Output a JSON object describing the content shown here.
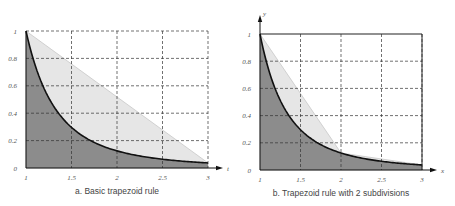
{
  "chart_data": [
    {
      "type": "area",
      "title": "a. Basic trapezoid rule",
      "function": "1/t^3",
      "xlabel": "t",
      "ylabel": "",
      "x_ticks": [
        "1",
        "1.5",
        "2",
        "2.5",
        "3"
      ],
      "y_ticks": [
        "0",
        "0.2",
        "0.4",
        "0.6",
        "0.8",
        "1"
      ],
      "xlim": [
        1,
        3
      ],
      "ylim": [
        0,
        1
      ],
      "grid": true,
      "curve": {
        "x": [
          1,
          1.25,
          1.5,
          1.75,
          2,
          2.5,
          3
        ],
        "y": [
          1,
          0.512,
          0.296,
          0.187,
          0.125,
          0.064,
          0.037
        ]
      },
      "trapezoids": [
        {
          "x": [
            1,
            3
          ],
          "y": [
            1,
            0.037
          ]
        }
      ]
    },
    {
      "type": "area",
      "title": "b. Trapezoid rule with 2 subdivisions",
      "function": "1/x^3",
      "xlabel": "x",
      "ylabel": "y",
      "x_ticks": [
        "1",
        "1.5",
        "2",
        "2.5",
        "3"
      ],
      "y_ticks": [
        "0",
        "0.2",
        "0.4",
        "0.6",
        "0.8",
        "1"
      ],
      "xlim": [
        1,
        3
      ],
      "ylim": [
        0,
        1
      ],
      "grid": true,
      "curve": {
        "x": [
          1,
          1.25,
          1.5,
          1.75,
          2,
          2.5,
          3
        ],
        "y": [
          1,
          0.512,
          0.296,
          0.187,
          0.125,
          0.064,
          0.037
        ]
      },
      "trapezoids": [
        {
          "x": [
            1,
            2
          ],
          "y": [
            1,
            0.125
          ]
        },
        {
          "x": [
            2,
            3
          ],
          "y": [
            0.125,
            0.037
          ]
        }
      ]
    }
  ],
  "captions": {
    "a": "a. Basic trapezoid rule",
    "b": "b. Trapezoid rule with 2 subdivisions"
  },
  "axes": {
    "a_x": "t",
    "b_x": "x",
    "b_y": "y"
  },
  "ticks": {
    "x": [
      "1",
      "1.5",
      "2",
      "2.5",
      "3"
    ],
    "y": [
      "0",
      "0.2",
      "0.4",
      "0.6",
      "0.8",
      "1"
    ]
  }
}
